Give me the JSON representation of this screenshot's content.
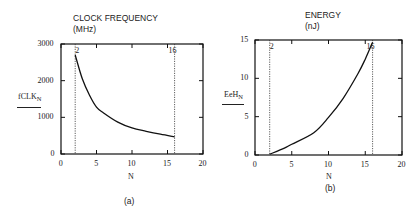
{
  "chart_data": [
    {
      "type": "line",
      "title": "CLOCK FREQUENCY",
      "subtitle": "(MHz)",
      "xlabel": "N",
      "ylabel": "fCLK",
      "ylabel_sub": "N",
      "xlim": [
        0,
        20
      ],
      "ylim": [
        0,
        3000
      ],
      "xticks": [
        "0",
        "5",
        "10",
        "15",
        "20"
      ],
      "yticks": [
        "0",
        "1000",
        "2000",
        "3000"
      ],
      "grid": false,
      "markers": [
        {
          "x": 2,
          "label": "2"
        },
        {
          "x": 16,
          "label": "16"
        }
      ],
      "x": [
        2,
        3,
        4,
        5,
        6,
        8,
        10,
        12,
        14,
        16
      ],
      "values": [
        2700,
        2050,
        1610,
        1280,
        1120,
        870,
        710,
        620,
        540,
        470
      ],
      "caption": "(a)"
    },
    {
      "type": "line",
      "title": "ENERGY",
      "subtitle": "(nJ)",
      "xlabel": "N",
      "ylabel": "EeH",
      "ylabel_sub": "N",
      "xlim": [
        0,
        20
      ],
      "ylim": [
        0,
        15
      ],
      "xticks": [
        "0",
        "5",
        "10",
        "15",
        "20"
      ],
      "yticks": [
        "0",
        "5",
        "10",
        "15"
      ],
      "grid": false,
      "markers": [
        {
          "x": 2,
          "label": "2"
        },
        {
          "x": 16,
          "label": "16"
        }
      ],
      "x": [
        2,
        4,
        5,
        8,
        10,
        12,
        14,
        15,
        16
      ],
      "values": [
        0.1,
        0.9,
        1.4,
        2.9,
        4.9,
        7.4,
        10.6,
        12.5,
        14.7
      ],
      "caption": "(b)"
    }
  ]
}
